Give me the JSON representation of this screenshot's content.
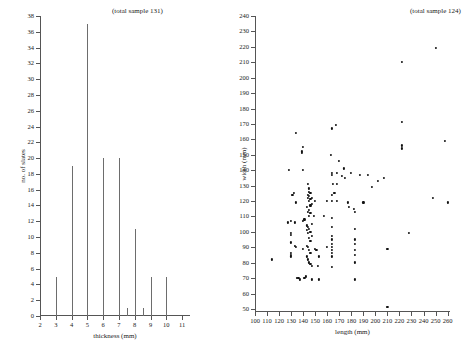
{
  "figure": {
    "background": "#ffffff",
    "ink": "#1a1a1a",
    "axis_color": "#555555",
    "spike_color": "#6d6d6d",
    "point_color": "#111111"
  },
  "panels": [
    {
      "id": "thickness",
      "note": "(total sample 131)",
      "xlabel": "thickness (mm)",
      "ylabel": "no. of slates"
    },
    {
      "id": "length-width",
      "note": "(total sample 124)",
      "xlabel": "length (mm)",
      "ylabel": "width (mm)"
    }
  ],
  "chart_data": [
    {
      "type": "bar",
      "id": "thickness-histogram",
      "title": "",
      "annotation": "(total sample 131)",
      "xlabel": "thickness (mm)",
      "ylabel": "no. of slates",
      "xlim": [
        2,
        11.5
      ],
      "ylim": [
        0,
        38
      ],
      "xticks": [
        2,
        3,
        4,
        5,
        6,
        7,
        8,
        9,
        10,
        11
      ],
      "yticks": [
        0,
        2,
        4,
        6,
        8,
        10,
        12,
        14,
        16,
        18,
        20,
        22,
        24,
        26,
        28,
        30,
        32,
        34,
        36,
        38
      ],
      "grid": false,
      "legend": null,
      "style": "impulse-spikes",
      "categories": [
        3,
        4,
        5,
        6,
        7,
        7.5,
        8,
        8.5,
        9,
        10
      ],
      "values": [
        5,
        19,
        37,
        20,
        20,
        1,
        11,
        1,
        5,
        5
      ]
    },
    {
      "type": "scatter",
      "id": "length-width-scatter",
      "title": "",
      "annotation": "(total sample 124)",
      "xlabel": "length (mm)",
      "ylabel": "width (mm)",
      "xlim": [
        100,
        262
      ],
      "ylim": [
        48,
        240
      ],
      "xticks": [
        100,
        110,
        120,
        130,
        140,
        150,
        160,
        170,
        180,
        190,
        200,
        210,
        220,
        230,
        240,
        250,
        260
      ],
      "yticks": [
        50,
        60,
        70,
        80,
        90,
        100,
        110,
        120,
        130,
        140,
        150,
        160,
        170,
        180,
        190,
        200,
        210,
        220,
        230,
        240
      ],
      "grid": false,
      "legend": null,
      "points": [
        [
          114,
          82
        ],
        [
          127,
          106
        ],
        [
          128,
          140
        ],
        [
          130,
          107
        ],
        [
          130,
          99
        ],
        [
          130,
          98
        ],
        [
          130,
          93
        ],
        [
          130,
          86
        ],
        [
          130,
          85
        ],
        [
          130,
          84
        ],
        [
          131,
          124
        ],
        [
          132,
          125
        ],
        [
          133,
          106
        ],
        [
          133,
          91
        ],
        [
          134,
          164
        ],
        [
          134,
          119
        ],
        [
          134,
          90
        ],
        [
          135,
          70
        ],
        [
          136,
          70
        ],
        [
          137,
          69
        ],
        [
          139,
          152
        ],
        [
          139,
          151
        ],
        [
          140,
          155
        ],
        [
          140,
          140
        ],
        [
          140,
          107
        ],
        [
          140,
          89
        ],
        [
          141,
          108
        ],
        [
          141,
          70
        ],
        [
          142,
          71
        ],
        [
          143,
          116
        ],
        [
          143,
          104
        ],
        [
          143,
          101
        ],
        [
          143,
          91
        ],
        [
          143,
          84
        ],
        [
          144,
          131
        ],
        [
          144,
          124
        ],
        [
          144,
          122
        ],
        [
          144,
          113
        ],
        [
          144,
          103
        ],
        [
          144,
          99
        ],
        [
          144,
          90
        ],
        [
          144,
          82
        ],
        [
          145,
          128
        ],
        [
          145,
          126
        ],
        [
          145,
          123
        ],
        [
          145,
          120
        ],
        [
          145,
          114
        ],
        [
          145,
          110
        ],
        [
          145,
          102
        ],
        [
          145,
          96
        ],
        [
          145,
          88
        ],
        [
          145,
          80
        ],
        [
          146,
          125
        ],
        [
          146,
          121
        ],
        [
          146,
          117
        ],
        [
          146,
          112
        ],
        [
          146,
          100
        ],
        [
          146,
          94
        ],
        [
          146,
          86
        ],
        [
          146,
          79
        ],
        [
          147,
          122
        ],
        [
          147,
          118
        ],
        [
          147,
          105
        ],
        [
          147,
          97
        ],
        [
          147,
          78
        ],
        [
          147,
          69
        ],
        [
          149,
          110
        ],
        [
          150,
          120
        ],
        [
          150,
          89
        ],
        [
          151,
          88
        ],
        [
          152,
          78
        ],
        [
          153,
          84
        ],
        [
          153,
          69
        ],
        [
          157,
          110
        ],
        [
          160,
          120
        ],
        [
          160,
          90
        ],
        [
          163,
          150
        ],
        [
          164,
          167
        ],
        [
          164,
          138
        ],
        [
          164,
          137
        ],
        [
          164,
          124
        ],
        [
          164,
          120
        ],
        [
          164,
          109
        ],
        [
          164,
          103
        ],
        [
          164,
          97
        ],
        [
          164,
          95
        ],
        [
          164,
          92
        ],
        [
          164,
          90
        ],
        [
          164,
          88
        ],
        [
          164,
          86
        ],
        [
          164,
          84
        ],
        [
          164,
          77
        ],
        [
          165,
          131
        ],
        [
          166,
          125
        ],
        [
          167,
          169
        ],
        [
          168,
          131
        ],
        [
          168,
          120
        ],
        [
          168,
          138
        ],
        [
          170,
          146
        ],
        [
          172,
          136
        ],
        [
          174,
          141
        ],
        [
          175,
          135
        ],
        [
          177,
          119
        ],
        [
          178,
          116
        ],
        [
          180,
          138
        ],
        [
          182,
          115
        ],
        [
          183,
          113
        ],
        [
          183,
          102
        ],
        [
          183,
          95
        ],
        [
          183,
          92
        ],
        [
          183,
          88
        ],
        [
          183,
          85
        ],
        [
          183,
          80
        ],
        [
          183,
          69
        ],
        [
          187,
          137
        ],
        [
          190,
          119
        ],
        [
          194,
          137
        ],
        [
          197,
          129
        ],
        [
          202,
          133
        ],
        [
          207,
          135
        ],
        [
          210,
          51
        ],
        [
          210,
          89
        ],
        [
          222,
          210
        ],
        [
          222,
          171
        ],
        [
          222,
          156
        ],
        [
          222,
          154
        ],
        [
          228,
          99
        ],
        [
          248,
          122
        ],
        [
          250,
          219
        ],
        [
          258,
          159
        ],
        [
          260,
          119
        ]
      ]
    }
  ]
}
